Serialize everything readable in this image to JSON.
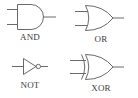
{
  "diagram": {
    "stroke_color": "#6a6a6a",
    "label_color": "#3a3a3a",
    "background": "#ffffff",
    "gates": [
      {
        "id": "and",
        "label": "AND",
        "inputs": 2,
        "outputs": 1
      },
      {
        "id": "or",
        "label": "OR",
        "inputs": 2,
        "outputs": 1
      },
      {
        "id": "not",
        "label": "NOT",
        "inputs": 1,
        "outputs": 1
      },
      {
        "id": "xor",
        "label": "XOR",
        "inputs": 2,
        "outputs": 1
      }
    ]
  }
}
